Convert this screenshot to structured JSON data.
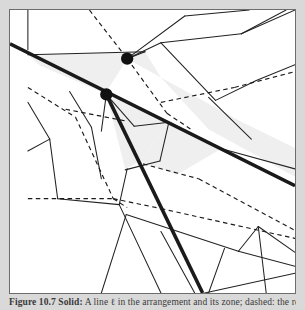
{
  "figure": {
    "caption_label": "Figure 10.7",
    "caption_lead": "Solid:",
    "caption_text": "A line ℓ in the arrangement and its zone; dashed: the remaining lines.",
    "background_color": "#d9d9d9",
    "panel_color": "#ffffff",
    "frame_color": "#6d6d6d",
    "shading_color": "#efefef",
    "solid_line_color": "#1a1a1a",
    "thin_line_color": "#222222",
    "dashed_line_color": "#1a1a1a",
    "vertex_color": "#111111"
  },
  "chart_data": {
    "type": "diagram",
    "xlabel": "",
    "ylabel": "",
    "xlim": [
      0,
      287
    ],
    "ylim": [
      0,
      285
    ],
    "grid": false,
    "legend": "none",
    "annotations": [
      "Thick solid: the line ℓ and its second solid partner",
      "Light gray cells: the zone of ℓ",
      "Dashed segments: remaining lines of the arrangement",
      "Black disks: two highlighted vertices of the arrangement"
    ],
    "vertices": [
      {
        "name": "vertex-upper",
        "x": 118,
        "y": 49,
        "r": 6.2
      },
      {
        "name": "vertex-lower",
        "x": 97,
        "y": 85,
        "r": 6.2
      }
    ],
    "thick_lines": [
      {
        "name": "line-ell",
        "x1": 0,
        "y1": 34,
        "x2": 287,
        "y2": 177,
        "width": 3.6
      },
      {
        "name": "line-second",
        "x1": 97,
        "y1": 85,
        "x2": 194,
        "y2": 285,
        "width": 3.6
      }
    ],
    "zone_cells": [
      {
        "name": "zone-cell-upper",
        "points": "18,45 136,42 152,68 118,49 96,84 30,56"
      },
      {
        "name": "zone-cell-mid",
        "points": "97,85 160,113 131,152 116,160"
      },
      {
        "name": "zone-cell-right",
        "points": "152,68 232,112 287,139 287,168 200,120"
      },
      {
        "name": "zone-cell-lower",
        "points": "131,152 160,113 214,139 168,166"
      }
    ],
    "thin_lines": [
      {
        "x1": 18,
        "y1": 0,
        "x2": 18,
        "y2": 40
      },
      {
        "x1": 18,
        "y1": 45,
        "x2": 136,
        "y2": 42
      },
      {
        "x1": 136,
        "y1": 42,
        "x2": 118,
        "y2": 49
      },
      {
        "x1": 118,
        "y1": 49,
        "x2": 176,
        "y2": 6
      },
      {
        "x1": 118,
        "y1": 49,
        "x2": 152,
        "y2": 33
      },
      {
        "x1": 152,
        "y1": 33,
        "x2": 233,
        "y2": 24
      },
      {
        "x1": 233,
        "y1": 24,
        "x2": 278,
        "y2": 0
      },
      {
        "x1": 152,
        "y1": 33,
        "x2": 207,
        "y2": 91
      },
      {
        "x1": 207,
        "y1": 91,
        "x2": 248,
        "y2": 71
      },
      {
        "x1": 248,
        "y1": 71,
        "x2": 287,
        "y2": 55
      },
      {
        "x1": 233,
        "y1": 24,
        "x2": 287,
        "y2": 0
      },
      {
        "x1": 176,
        "y1": 6,
        "x2": 241,
        "y2": 0
      },
      {
        "x1": 97,
        "y1": 85,
        "x2": 92,
        "y2": 122
      },
      {
        "x1": 97,
        "y1": 85,
        "x2": 125,
        "y2": 117
      },
      {
        "x1": 125,
        "y1": 117,
        "x2": 160,
        "y2": 113
      },
      {
        "x1": 160,
        "y1": 113,
        "x2": 151,
        "y2": 152
      },
      {
        "x1": 151,
        "y1": 152,
        "x2": 116,
        "y2": 161
      },
      {
        "x1": 160,
        "y1": 113,
        "x2": 214,
        "y2": 140
      },
      {
        "x1": 214,
        "y1": 140,
        "x2": 287,
        "y2": 160
      },
      {
        "x1": 200,
        "y1": 88,
        "x2": 243,
        "y2": 130
      },
      {
        "x1": 18,
        "y1": 93,
        "x2": 40,
        "y2": 130
      },
      {
        "x1": 18,
        "y1": 142,
        "x2": 40,
        "y2": 130
      },
      {
        "x1": 40,
        "y1": 130,
        "x2": 48,
        "y2": 190
      },
      {
        "x1": 48,
        "y1": 190,
        "x2": 110,
        "y2": 196
      },
      {
        "x1": 110,
        "y1": 196,
        "x2": 118,
        "y2": 160
      },
      {
        "x1": 60,
        "y1": 82,
        "x2": 82,
        "y2": 118
      },
      {
        "x1": 82,
        "y1": 118,
        "x2": 92,
        "y2": 170
      },
      {
        "x1": 110,
        "y1": 196,
        "x2": 152,
        "y2": 285
      },
      {
        "x1": 117,
        "y1": 206,
        "x2": 92,
        "y2": 285
      },
      {
        "x1": 117,
        "y1": 206,
        "x2": 230,
        "y2": 243
      },
      {
        "x1": 230,
        "y1": 243,
        "x2": 287,
        "y2": 258
      },
      {
        "x1": 152,
        "y1": 223,
        "x2": 186,
        "y2": 285
      },
      {
        "x1": 230,
        "y1": 243,
        "x2": 250,
        "y2": 218
      },
      {
        "x1": 250,
        "y1": 218,
        "x2": 287,
        "y2": 244
      },
      {
        "x1": 250,
        "y1": 218,
        "x2": 258,
        "y2": 285
      },
      {
        "x1": 216,
        "y1": 240,
        "x2": 200,
        "y2": 285
      },
      {
        "x1": 287,
        "y1": 265,
        "x2": 196,
        "y2": 285
      }
    ],
    "dashed_lines": [
      {
        "x1": 80,
        "y1": 0,
        "x2": 118,
        "y2": 49
      },
      {
        "x1": 118,
        "y1": 49,
        "x2": 158,
        "y2": 104
      },
      {
        "x1": 158,
        "y1": 104,
        "x2": 182,
        "y2": 120
      },
      {
        "x1": 18,
        "y1": 78,
        "x2": 66,
        "y2": 108
      },
      {
        "x1": 66,
        "y1": 108,
        "x2": 104,
        "y2": 190
      },
      {
        "x1": 104,
        "y1": 190,
        "x2": 118,
        "y2": 199
      },
      {
        "x1": 18,
        "y1": 190,
        "x2": 104,
        "y2": 190
      },
      {
        "x1": 104,
        "y1": 190,
        "x2": 152,
        "y2": 200
      },
      {
        "x1": 152,
        "y1": 200,
        "x2": 287,
        "y2": 230
      },
      {
        "x1": 152,
        "y1": 93,
        "x2": 226,
        "y2": 78
      },
      {
        "x1": 226,
        "y1": 78,
        "x2": 287,
        "y2": 62
      },
      {
        "x1": 134,
        "y1": 155,
        "x2": 190,
        "y2": 170
      },
      {
        "x1": 190,
        "y1": 170,
        "x2": 287,
        "y2": 222
      },
      {
        "x1": 56,
        "y1": 100,
        "x2": 118,
        "y2": 112
      }
    ]
  }
}
